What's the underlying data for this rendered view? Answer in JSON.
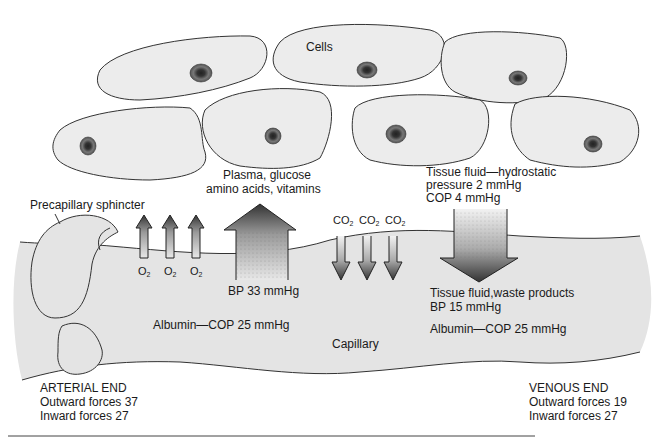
{
  "diagram": {
    "title_label": "Cells",
    "structures": {
      "sphincter": "Precapillary sphincter",
      "capillary": "Capillary"
    },
    "arterial_side": {
      "nutrients": [
        "Plasma, glucose",
        "amino acids, vitamins"
      ],
      "gas": "O",
      "gas_sub": "2",
      "gas_count": 3,
      "bp": "BP 33 mmHg",
      "albumin": "Albumin—COP 25 mmHg"
    },
    "venous_side": {
      "tissue_fluid": [
        "Tissue fluid—hydrostatic",
        "pressure 2 mmHg",
        "COP 4 mmHg"
      ],
      "gas": "CO",
      "gas_sub": "2",
      "gas_count": 3,
      "waste": "Tissue fluid,waste products",
      "bp": "BP 15 mmHg",
      "albumin": "Albumin—COP 25 mmHg"
    },
    "arterial_end": {
      "title": "ARTERIAL END",
      "outward": "Outward forces 37",
      "inward": "Inward forces 27"
    },
    "venous_end": {
      "title": "VENOUS END",
      "outward": "Outward forces 19",
      "inward": "Inward forces 27"
    },
    "colors": {
      "cell_fill": "#ebebeb",
      "capillary_fill": "#e6e6e6",
      "outline": "#333333",
      "nucleus": "#555555"
    }
  }
}
